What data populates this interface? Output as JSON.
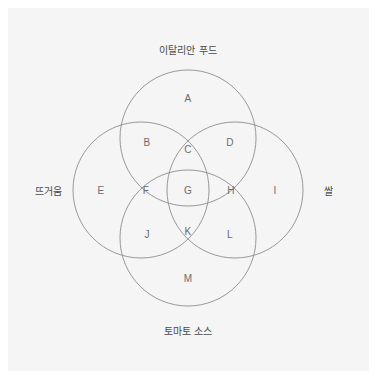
{
  "diagram": {
    "type": "venn-4set",
    "title_visible": false,
    "background_color": "#f5f5f5",
    "page_color": "#ffffff",
    "stroke_color": "#8d8d8d",
    "label_color": "#6b6b6b",
    "set_label_color": "#4a4a4a",
    "sets": [
      {
        "id": "top",
        "label": "이탈리안 푸드",
        "label_x": 188,
        "label_y": 49,
        "cx": 188,
        "cy": 138,
        "r": 68
      },
      {
        "id": "left",
        "label": "뜨거움",
        "label_x": 48,
        "label_y": 190,
        "cx": 141,
        "cy": 190,
        "r": 68
      },
      {
        "id": "right",
        "label": "쌀",
        "label_x": 328,
        "label_y": 190,
        "cx": 235,
        "cy": 190,
        "r": 68
      },
      {
        "id": "bottom",
        "label": "토마토 소스",
        "label_x": 188,
        "label_y": 330,
        "cx": 188,
        "cy": 238,
        "r": 68
      }
    ],
    "regions": [
      {
        "id": "A",
        "label": "A",
        "x": 188,
        "y": 98,
        "members": [
          "top"
        ]
      },
      {
        "id": "B",
        "label": "B",
        "x": 147,
        "y": 142,
        "members": [
          "top",
          "left"
        ]
      },
      {
        "id": "C",
        "label": "C",
        "x": 188,
        "y": 149,
        "members": [
          "top",
          "left",
          "right"
        ]
      },
      {
        "id": "D",
        "label": "D",
        "x": 230,
        "y": 142,
        "members": [
          "top",
          "right"
        ]
      },
      {
        "id": "E",
        "label": "E",
        "x": 101,
        "y": 190,
        "members": [
          "left"
        ]
      },
      {
        "id": "F",
        "label": "F",
        "x": 146,
        "y": 190,
        "members": [
          "left",
          "bottom"
        ]
      },
      {
        "id": "G",
        "label": "G",
        "x": 188,
        "y": 190,
        "members": [
          "top",
          "left",
          "right",
          "bottom"
        ]
      },
      {
        "id": "H",
        "label": "H",
        "x": 231,
        "y": 190,
        "members": [
          "right",
          "bottom"
        ]
      },
      {
        "id": "I",
        "label": "I",
        "x": 275,
        "y": 190,
        "members": [
          "right"
        ]
      },
      {
        "id": "J",
        "label": "J",
        "x": 147,
        "y": 234,
        "members": [
          "left",
          "bottom"
        ]
      },
      {
        "id": "K",
        "label": "K",
        "x": 188,
        "y": 231,
        "members": [
          "left",
          "right",
          "bottom"
        ]
      },
      {
        "id": "L",
        "label": "L",
        "x": 230,
        "y": 234,
        "members": [
          "right",
          "bottom"
        ]
      },
      {
        "id": "M",
        "label": "M",
        "x": 188,
        "y": 278,
        "members": [
          "bottom"
        ]
      }
    ]
  }
}
